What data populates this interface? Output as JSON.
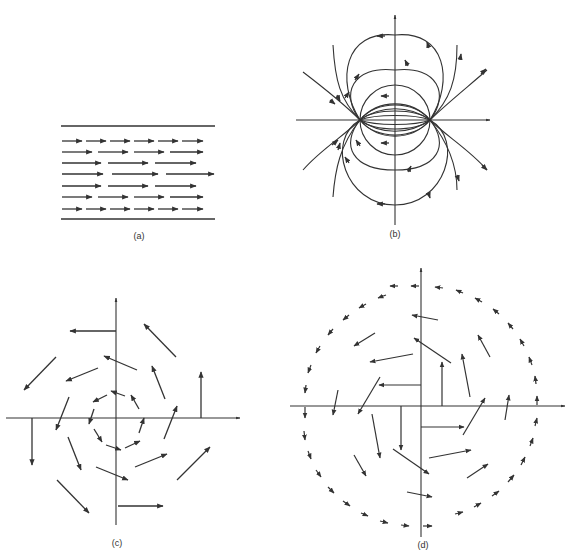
{
  "figure": {
    "panels": [
      {
        "id": "a",
        "label": "(a)",
        "description": "Uniform parallel flow between two plates"
      },
      {
        "id": "b",
        "label": "(b)",
        "description": "Dipole / source-sink field lines"
      },
      {
        "id": "c",
        "label": "(c)",
        "description": "Rotational (vortex) vector field, magnitude increasing with radius"
      },
      {
        "id": "d",
        "label": "(d)",
        "description": "Rotational vector field within a circular region"
      }
    ],
    "colors": {
      "ink": "#333333",
      "background": "#ffffff"
    }
  }
}
